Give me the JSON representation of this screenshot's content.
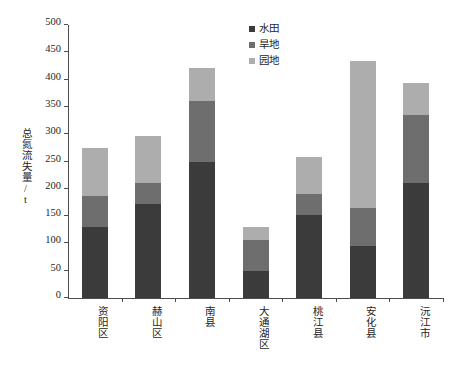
{
  "chart_data": {
    "type": "bar",
    "stacked": true,
    "title": "",
    "xlabel": "",
    "ylabel": "总氮流失量/t",
    "ylim": [
      0,
      500
    ],
    "ytick_step": 50,
    "yticks": [
      0,
      50,
      100,
      150,
      200,
      250,
      300,
      350,
      400,
      450,
      500
    ],
    "grid": false,
    "legend_position": "top-right",
    "categories": [
      "资阳区",
      "赫山区",
      "南县",
      "大通湖区",
      "桃江县",
      "安化县",
      "沅江市"
    ],
    "series": [
      {
        "name": "水田",
        "color": "#3b3b3b",
        "values": [
          130,
          172,
          249,
          49,
          152,
          95,
          210
        ]
      },
      {
        "name": "旱地",
        "color": "#6e6e6e",
        "values": [
          57,
          38,
          112,
          57,
          38,
          70,
          126
        ]
      },
      {
        "name": "园地",
        "color": "#adadad",
        "values": [
          88,
          86,
          60,
          24,
          69,
          269,
          58
        ]
      }
    ],
    "totals": [
      275,
      296,
      421,
      130,
      259,
      434,
      394
    ]
  },
  "axis": {
    "y_title": "总氮流失量/t"
  },
  "legend": {
    "items": [
      {
        "label": "水田",
        "color": "#3b3b3b"
      },
      {
        "label": "旱地",
        "color": "#6e6e6e"
      },
      {
        "label": "园地",
        "color": "#adadad"
      }
    ]
  }
}
